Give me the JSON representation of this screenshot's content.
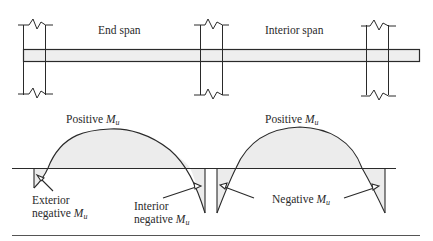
{
  "diagram": {
    "type": "continuous-beam-moment-diagram",
    "beam": {
      "spans": [
        {
          "name": "end_span",
          "label": "End span"
        },
        {
          "name": "interior_span",
          "label": "Interior span"
        }
      ],
      "supports": [
        "exterior-column",
        "first-interior-column",
        "second-interior-column"
      ]
    },
    "moment_labels": {
      "positive_end": {
        "text": "Positive ",
        "symbol": "M",
        "subscript": "u"
      },
      "positive_interior": {
        "text": "Positive ",
        "symbol": "M",
        "subscript": "u"
      },
      "exterior_negative": {
        "line1": "Exterior",
        "line2": "negative ",
        "symbol": "M",
        "subscript": "u"
      },
      "interior_negative": {
        "line1": "Interior",
        "line2": "negative ",
        "symbol": "M",
        "subscript": "u"
      },
      "negative": {
        "text": "Negative ",
        "symbol": "M",
        "subscript": "u"
      }
    },
    "colors": {
      "line": "#2a2a2a",
      "beam_fill": "#eeeeee",
      "moment_fill": "#ececec",
      "background": "#ffffff"
    }
  }
}
